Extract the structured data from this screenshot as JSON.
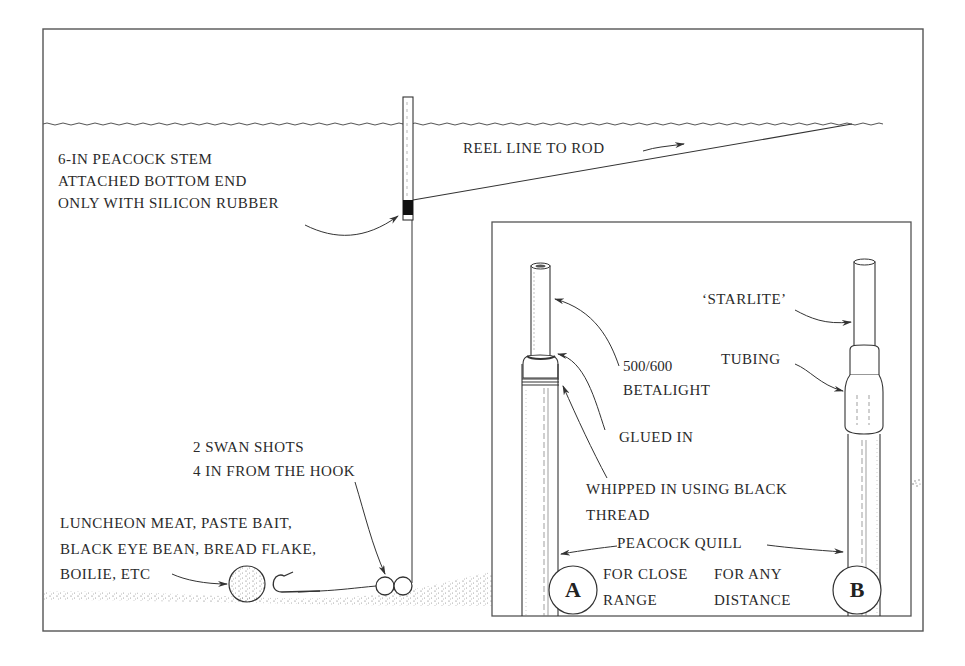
{
  "diagram": {
    "colors": {
      "ink": "#333333",
      "background": "#ffffff",
      "ground_stipple": "#777777"
    },
    "main_rig": {
      "labels": {
        "float_line1": "6-IN PEACOCK STEM",
        "float_line2": "ATTACHED BOTTOM END",
        "float_line3": "ONLY WITH SILICON RUBBER",
        "reel_line": "REEL LINE TO ROD",
        "shots_line1": "2 SWAN SHOTS",
        "shots_line2": "4 IN FROM THE HOOK",
        "bait_line1": "LUNCHEON MEAT, PASTE BAIT,",
        "bait_line2": "BLACK EYE BEAN, BREAD FLAKE,",
        "bait_line3": "BOILIE, ETC"
      }
    },
    "inset": {
      "labels": {
        "betalight_line1": "500/600",
        "betalight_line2": "BETALIGHT",
        "glued_in": "GLUED IN",
        "whipped_line1": "WHIPPED IN USING BLACK",
        "whipped_line2": "THREAD",
        "peacock_quill": "PEACOCK QUILL",
        "starlite": "‘STARLITE’",
        "tubing": "TUBING",
        "a_line1": "FOR CLOSE",
        "a_line2": "RANGE",
        "b_line1": "FOR ANY",
        "b_line2": "DISTANCE"
      },
      "variants": [
        {
          "letter": "A",
          "description": "FOR CLOSE RANGE"
        },
        {
          "letter": "B",
          "description": "FOR ANY DISTANCE"
        }
      ]
    }
  }
}
